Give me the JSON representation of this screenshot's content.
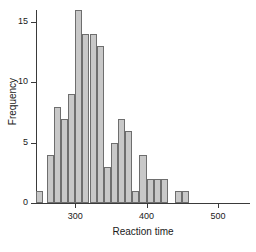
{
  "chart_data": {
    "type": "bar",
    "title": "",
    "subtitle": "",
    "xlabel": "Reaction time",
    "ylabel": "Frequency",
    "xlim": [
      245,
      545
    ],
    "ylim": [
      0,
      16
    ],
    "grid": false,
    "legend": null,
    "bin_width": 10,
    "bin_starts": [
      245,
      255,
      265,
      275,
      285,
      295,
      305,
      315,
      325,
      335,
      345,
      355,
      365,
      375,
      385,
      395,
      405,
      415,
      425,
      435,
      445,
      455,
      465,
      475,
      485,
      495,
      505,
      515,
      525
    ],
    "categories": [
      "245-255",
      "255-265",
      "265-275",
      "275-285",
      "285-295",
      "295-305",
      "305-315",
      "315-325",
      "325-335",
      "335-345",
      "345-355",
      "355-365",
      "365-375",
      "375-385",
      "385-395",
      "395-405",
      "405-415",
      "415-425",
      "425-435",
      "435-445",
      "445-455",
      "455-465",
      "465-475",
      "475-485",
      "485-495",
      "495-505",
      "505-515",
      "515-525",
      "525-535"
    ],
    "values": [
      1,
      0,
      4,
      8,
      7,
      9,
      16,
      14,
      14,
      13,
      3,
      5,
      7,
      6,
      1,
      4,
      2,
      2,
      2,
      0,
      1,
      1,
      0,
      0,
      0,
      0,
      0,
      0,
      0
    ],
    "bars": [
      {
        "x0": 245,
        "x1": 255,
        "value": 1
      },
      {
        "x0": 260,
        "x1": 270,
        "value": 4
      },
      {
        "x0": 270,
        "x1": 280,
        "value": 8
      },
      {
        "x0": 280,
        "x1": 290,
        "value": 7
      },
      {
        "x0": 290,
        "x1": 300,
        "value": 9
      },
      {
        "x0": 300,
        "x1": 310,
        "value": 16
      },
      {
        "x0": 310,
        "x1": 320,
        "value": 14
      },
      {
        "x0": 320,
        "x1": 330,
        "value": 14
      },
      {
        "x0": 330,
        "x1": 340,
        "value": 13
      },
      {
        "x0": 340,
        "x1": 350,
        "value": 3
      },
      {
        "x0": 350,
        "x1": 360,
        "value": 5
      },
      {
        "x0": 360,
        "x1": 370,
        "value": 7
      },
      {
        "x0": 370,
        "x1": 380,
        "value": 6
      },
      {
        "x0": 380,
        "x1": 390,
        "value": 1
      },
      {
        "x0": 390,
        "x1": 400,
        "value": 4
      },
      {
        "x0": 400,
        "x1": 410,
        "value": 2
      },
      {
        "x0": 410,
        "x1": 420,
        "value": 2
      },
      {
        "x0": 420,
        "x1": 430,
        "value": 2
      },
      {
        "x0": 440,
        "x1": 450,
        "value": 1
      },
      {
        "x0": 450,
        "x1": 460,
        "value": 1
      }
    ],
    "y_ticks": [
      0,
      5,
      10,
      15
    ],
    "y_tick_labels": [
      "0",
      "5",
      "10",
      "15"
    ],
    "x_ticks": [
      300,
      400,
      500
    ],
    "x_tick_labels": [
      "300",
      "400",
      "500"
    ],
    "bar_fill_color": "#c8c8c8",
    "bar_edge_color": "#6e6e6e",
    "axis_color": "#3a3a3a",
    "background_color": "#ffffff"
  }
}
